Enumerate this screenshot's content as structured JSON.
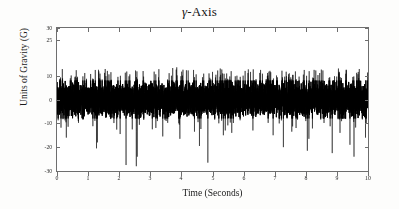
{
  "chart_data": {
    "type": "line",
    "title": "γ-Axis",
    "title_symbol": "γ",
    "title_suffix": "-Axis",
    "xlabel": "Time (Seconds)",
    "ylabel": "Units of Gravity (G)",
    "xlim": [
      0,
      10
    ],
    "ylim": [
      -30,
      30
    ],
    "xticks": [
      0,
      1,
      2,
      3,
      4,
      5,
      6,
      7,
      8,
      9,
      10
    ],
    "xticklabels": [
      "0",
      "1",
      "2",
      "3",
      "4",
      "5",
      "6",
      "7",
      "8",
      "9",
      "10"
    ],
    "yticks": [
      30,
      25,
      10,
      0,
      -10,
      -20,
      -30
    ],
    "yticklabels": [
      "30",
      "25",
      "10",
      "0",
      "-10",
      "-20",
      "-30"
    ],
    "grid": false,
    "legend": null,
    "series": [
      {
        "name": "gamma-axis acceleration",
        "color": "#000000",
        "description": "Dense broadband accelerometer noise trace sampled over 10 seconds",
        "sample_count": 8000,
        "sample_rate_hz": 800,
        "mean": 0,
        "noise_std": 3.0,
        "dense_band": [
          -8,
          8
        ],
        "typical_peak_high": 13,
        "typical_peak_low": -13,
        "max_value": 13.5,
        "min_value": -28.5,
        "negative_spike_times": [
          0.3,
          1.27,
          1.3,
          2.03,
          2.22,
          2.55,
          2.58,
          3.4,
          3.95,
          4.42,
          4.58,
          4.85,
          5.35,
          5.62,
          6.3,
          6.95,
          7.28,
          7.55,
          8.05,
          8.1,
          8.85,
          9.1,
          9.42,
          9.55,
          9.92
        ],
        "negative_spike_values": [
          -16.0,
          -20.5,
          -18.0,
          -14.5,
          -27.5,
          -28.0,
          -24.0,
          -15.5,
          -16.5,
          -13.5,
          -19.5,
          -26.5,
          -15.0,
          -14.0,
          -13.0,
          -15.0,
          -20.0,
          -13.5,
          -21.5,
          -16.5,
          -22.5,
          -14.0,
          -19.0,
          -24.0,
          -16.0
        ],
        "positive_spike_times": [
          1.55,
          1.62,
          3.72,
          3.85,
          4.05,
          5.25,
          5.3,
          6.05,
          7.95,
          8.55,
          9.05,
          9.3,
          9.72
        ],
        "positive_spike_values": [
          12.8,
          12.0,
          13.2,
          13.5,
          12.5,
          13.0,
          12.6,
          12.0,
          12.4,
          12.2,
          13.0,
          12.5,
          12.8
        ]
      }
    ]
  },
  "colors": {
    "trace": "#000000",
    "axis": "#6e6e6e",
    "text": "#1a1a1a",
    "background": "#fdfdfc",
    "plot_background": "#ffffff"
  }
}
